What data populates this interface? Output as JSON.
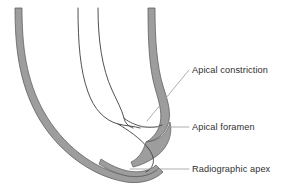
{
  "figure": {
    "background_color": "#ffffff",
    "width": 288,
    "height": 190
  },
  "style": {
    "root_band_fill": "#9d9d9d",
    "root_band_edge": "#4a4a4a",
    "canal_line_color": "#3d3d3d",
    "leader_line_color": "#9a9a9a",
    "text_color": "#2f2f2f"
  },
  "labels": [
    {
      "id": "apical-constriction",
      "text": "Apical constriction",
      "leader_from": {
        "x": 189,
        "y": 70
      },
      "leader_to": {
        "x": 147,
        "y": 121
      }
    },
    {
      "id": "apical-foramen",
      "text": "Apical foramen",
      "leader_from": {
        "x": 189,
        "y": 127
      },
      "leader_to": {
        "x": 139,
        "y": 127
      }
    },
    {
      "id": "radiographic-apex",
      "text": "Radiographic apex",
      "leader_from": {
        "x": 189,
        "y": 169
      },
      "leader_to": {
        "x": 130,
        "y": 169
      }
    }
  ],
  "structures": {
    "outer_root_left": "left outer root surface band",
    "outer_root_right": "right outer root surface band",
    "canal_wall_inner": "inner root canal wall line",
    "canal_wall_outer": "outer root canal wall line",
    "apex_curve": "rounded radiographic apex"
  }
}
